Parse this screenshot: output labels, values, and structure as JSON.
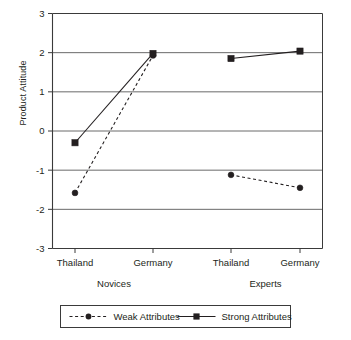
{
  "chart_data": {
    "type": "line",
    "title": "",
    "xlabel": "",
    "ylabel": "Product Attitude",
    "ylim": [
      -3,
      3
    ],
    "ytick_labels": [
      "3",
      "2",
      "1",
      "0",
      "-1",
      "-2",
      "-3"
    ],
    "ytick_values": [
      3,
      2,
      1,
      0,
      -1,
      -2,
      -3
    ],
    "grid": true,
    "legend_position": "bottom",
    "categories": [
      "Thailand",
      "Germany",
      "Thailand",
      "Germany"
    ],
    "groups": [
      {
        "label": "Novices",
        "categories": [
          "Thailand",
          "Germany"
        ]
      },
      {
        "label": "Experts",
        "categories": [
          "Thailand",
          "Germany"
        ]
      }
    ],
    "series": [
      {
        "name": "Weak Attributes",
        "marker": "circle",
        "line_style": "dashed",
        "color": "#231f20",
        "values": [
          -1.58,
          1.93,
          -1.12,
          -1.45
        ],
        "segments": [
          [
            0,
            1
          ],
          [
            2,
            3
          ]
        ]
      },
      {
        "name": "Strong Attributes",
        "marker": "square",
        "line_style": "solid",
        "color": "#231f20",
        "values": [
          -0.3,
          1.98,
          1.85,
          2.04
        ],
        "segments": [
          [
            0,
            1
          ],
          [
            2,
            3
          ]
        ]
      }
    ]
  },
  "legend": {
    "items": [
      {
        "label": "Weak Attributes",
        "marker": "circle",
        "line_style": "dashed"
      },
      {
        "label": "Strong Attributes",
        "marker": "square",
        "line_style": "solid"
      }
    ]
  },
  "axis": {
    "y_title": "Product Attitude"
  }
}
